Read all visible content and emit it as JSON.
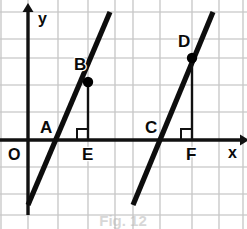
{
  "figure": {
    "caption": "Fig. 12",
    "background_color": "#ffffff",
    "grid_color": "#c9c9c9",
    "axis_color": "#111111",
    "line_color": "#0d0d0d"
  },
  "axes": {
    "x_axis_label": "x",
    "y_axis_label": "y",
    "origin_label": "O",
    "origin_px": {
      "x": 28,
      "y": 140
    },
    "x_axis_y_px": 140,
    "y_axis_x_px": 28,
    "x_axis_start_px": 0,
    "x_axis_end_px": 240,
    "y_axis_top_px": 12,
    "y_axis_bottom_px": 215,
    "x_label_px": {
      "x": 228,
      "y": 158
    },
    "y_label_px": {
      "x": 38,
      "y": 24
    },
    "origin_label_px": {
      "x": 8,
      "y": 160
    }
  },
  "grid": {
    "spacing_px": 27,
    "vertical_x_px": [
      1,
      28,
      58,
      88,
      115,
      133,
      160,
      192,
      219,
      243
    ],
    "horizontal_y_px": [
      12,
      39,
      58,
      85,
      112,
      140,
      167,
      194,
      215
    ]
  },
  "chart_data": {
    "type": "line",
    "title": "Fig. 12",
    "xlabel": "x",
    "ylabel": "y",
    "grid": true,
    "legend": "none",
    "series": [
      {
        "name": "line-1",
        "points_px": [
          {
            "x": 28,
            "y": 205
          },
          {
            "x": 110,
            "y": 12
          }
        ]
      },
      {
        "name": "line-2",
        "points_px": [
          {
            "x": 133,
            "y": 205
          },
          {
            "x": 213,
            "y": 12
          }
        ]
      }
    ],
    "annotations": [
      {
        "label": "A",
        "type": "x-intercept",
        "on": "line-1",
        "point_px": {
          "x": 58,
          "y": 140
        },
        "label_px": {
          "x": 40,
          "y": 133
        },
        "dot": false
      },
      {
        "label": "B",
        "type": "point-on-line",
        "on": "line-1",
        "point_px": {
          "x": 88,
          "y": 82
        },
        "label_px": {
          "x": 74,
          "y": 70
        },
        "dot": true
      },
      {
        "label": "C",
        "type": "x-intercept",
        "on": "line-2",
        "point_px": {
          "x": 160,
          "y": 140
        },
        "label_px": {
          "x": 145,
          "y": 133
        },
        "dot": false
      },
      {
        "label": "D",
        "type": "point-on-line",
        "on": "line-2",
        "point_px": {
          "x": 192,
          "y": 58
        },
        "label_px": {
          "x": 178,
          "y": 47
        },
        "dot": true
      },
      {
        "label": "E",
        "type": "foot-of-perpendicular",
        "from": "B",
        "point_px": {
          "x": 88,
          "y": 140
        },
        "label_px": {
          "x": 82,
          "y": 160
        },
        "dot": false
      },
      {
        "label": "F",
        "type": "foot-of-perpendicular",
        "from": "D",
        "point_px": {
          "x": 192,
          "y": 140
        },
        "label_px": {
          "x": 186,
          "y": 160
        },
        "dot": false
      }
    ],
    "perpendiculars": [
      {
        "name": "BE",
        "from_px": {
          "x": 88,
          "y": 82
        },
        "to_px": {
          "x": 88,
          "y": 140
        },
        "right_angle_at": {
          "x": 88,
          "y": 140
        }
      },
      {
        "name": "DF",
        "from_px": {
          "x": 192,
          "y": 58
        },
        "to_px": {
          "x": 192,
          "y": 140
        },
        "right_angle_at": {
          "x": 192,
          "y": 140
        }
      }
    ]
  }
}
